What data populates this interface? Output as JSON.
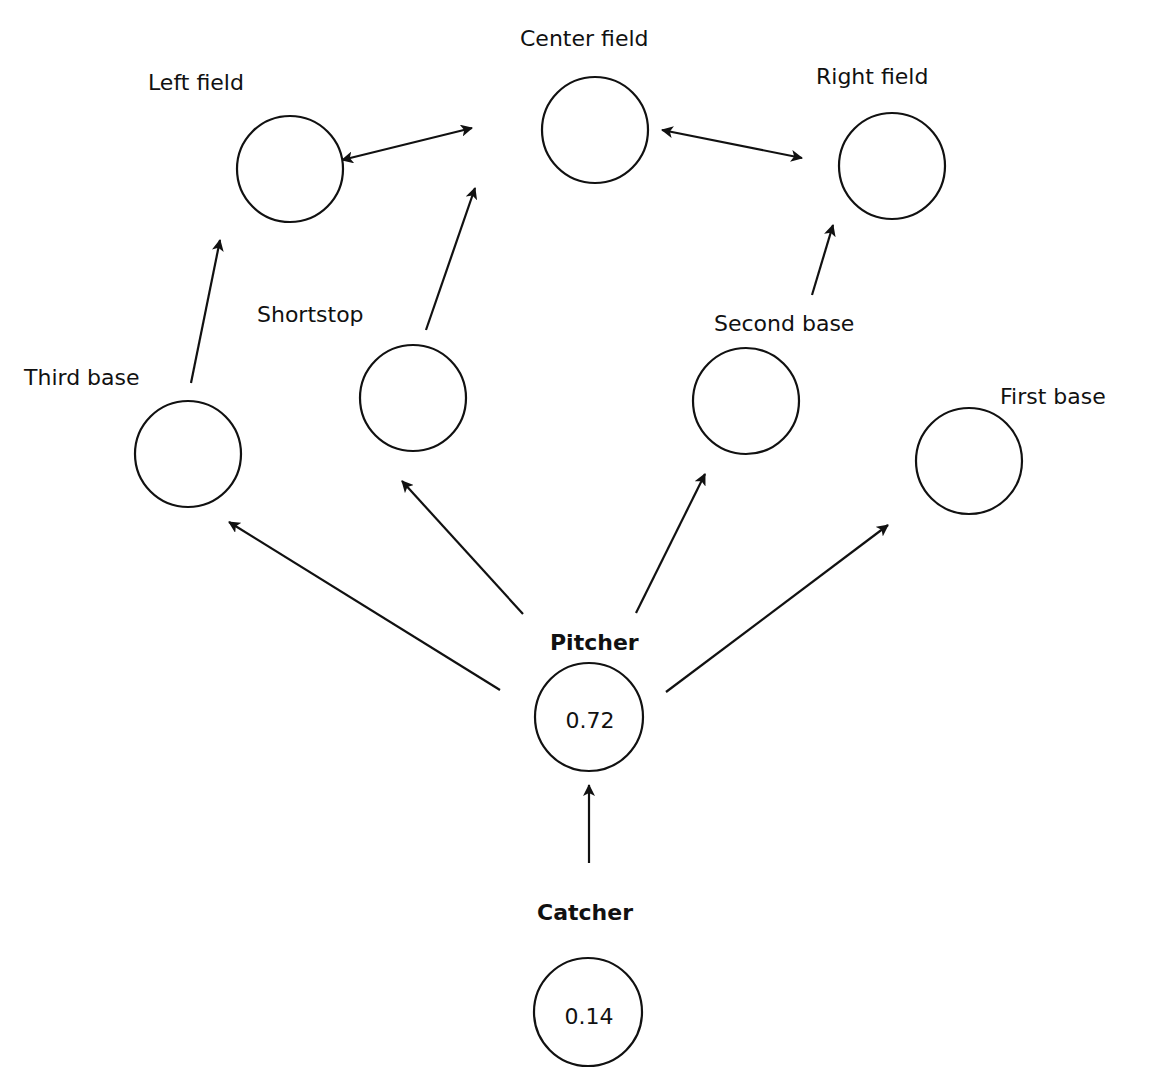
{
  "diagram": {
    "type": "directed-graph",
    "nodes": [
      {
        "id": "left_field",
        "label": "Left field",
        "value": "",
        "bold": false
      },
      {
        "id": "center_field",
        "label": "Center field",
        "value": "",
        "bold": false
      },
      {
        "id": "right_field",
        "label": "Right field",
        "value": "",
        "bold": false
      },
      {
        "id": "third_base",
        "label": "Third base",
        "value": "",
        "bold": false
      },
      {
        "id": "shortstop",
        "label": "Shortstop",
        "value": "",
        "bold": false
      },
      {
        "id": "second_base",
        "label": "Second base",
        "value": "",
        "bold": false
      },
      {
        "id": "first_base",
        "label": "First base",
        "value": "",
        "bold": false
      },
      {
        "id": "pitcher",
        "label": "Pitcher",
        "value": "0.72",
        "bold": true
      },
      {
        "id": "catcher",
        "label": "Catcher",
        "value": "0.14",
        "bold": true
      }
    ],
    "edges": [
      {
        "from": "catcher",
        "to": "pitcher",
        "bidirectional": false
      },
      {
        "from": "pitcher",
        "to": "third_base",
        "bidirectional": false
      },
      {
        "from": "pitcher",
        "to": "shortstop",
        "bidirectional": false
      },
      {
        "from": "pitcher",
        "to": "second_base",
        "bidirectional": false
      },
      {
        "from": "pitcher",
        "to": "first_base",
        "bidirectional": false
      },
      {
        "from": "third_base",
        "to": "left_field",
        "bidirectional": false
      },
      {
        "from": "shortstop",
        "to": "center_field",
        "bidirectional": false
      },
      {
        "from": "second_base",
        "to": "right_field",
        "bidirectional": false
      },
      {
        "from": "left_field",
        "to": "center_field",
        "bidirectional": true
      },
      {
        "from": "center_field",
        "to": "right_field",
        "bidirectional": true
      }
    ]
  },
  "labels": {
    "left_field": "Left field",
    "center_field": "Center field",
    "right_field": "Right field",
    "third_base": "Third base",
    "shortstop": "Shortstop",
    "second_base": "Second base",
    "first_base": "First base",
    "pitcher": "Pitcher",
    "catcher": "Catcher"
  },
  "values": {
    "pitcher": "0.72",
    "catcher": "0.14"
  },
  "colors": {
    "stroke": "#111111",
    "background": "#ffffff"
  }
}
